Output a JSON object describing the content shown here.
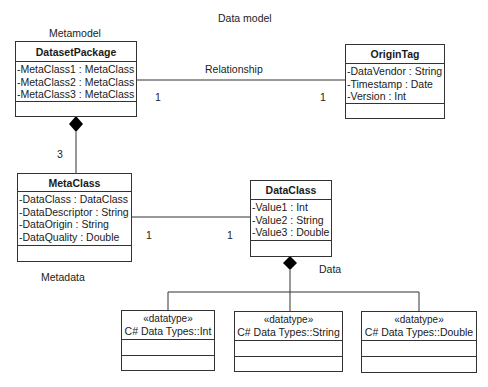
{
  "diagram": {
    "title": "Data model",
    "group_labels": {
      "metamodel": "Metamodel",
      "metadata": "Metadata",
      "data": "Data"
    },
    "classes": {
      "dataset_package": {
        "name": "DatasetPackage",
        "attributes": [
          "-MetaClass1 : MetaClass",
          "-MetaClass2 : MetaClass",
          "-MetaClass3 : MetaClass"
        ]
      },
      "origin_tag": {
        "name": "OriginTag",
        "attributes": [
          "-DataVendor : String",
          "-Timestamp : Date",
          "-Version : Int"
        ]
      },
      "meta_class": {
        "name": "MetaClass",
        "attributes": [
          "-DataClass : DataClass",
          "-DataDescriptor : String",
          "-DataOrigin : String",
          "-DataQuality : Double"
        ]
      },
      "data_class": {
        "name": "DataClass",
        "attributes": [
          "-Value1 : Int",
          "-Value2 : String",
          "-Value3 : Double"
        ]
      }
    },
    "datatypes": [
      {
        "stereotype": "«datatype»",
        "name": "C# Data Types::Int"
      },
      {
        "stereotype": "«datatype»",
        "name": "C# Data Types::String"
      },
      {
        "stereotype": "«datatype»",
        "name": "C# Data Types::Double"
      }
    ],
    "associations": {
      "relationship": {
        "label": "Relationship",
        "source_mult": "1",
        "target_mult": "1"
      },
      "composition_meta": {
        "mult": "3"
      },
      "meta_to_data": {
        "source_mult": "1",
        "target_mult": "1"
      }
    }
  }
}
